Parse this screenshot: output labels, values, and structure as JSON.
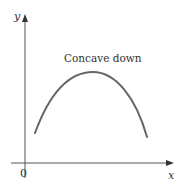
{
  "diagram": {
    "title": "Concave down",
    "axes": {
      "x_label": "x",
      "y_label": "y",
      "origin_label": "0"
    },
    "colors": {
      "axis": "#555555",
      "curve": "#6b6561",
      "text": "#333333"
    },
    "curve": {
      "shape": "concave-down arc",
      "start": [
        35,
        133
      ],
      "peak": [
        93,
        72
      ],
      "end": [
        147,
        137
      ]
    }
  }
}
